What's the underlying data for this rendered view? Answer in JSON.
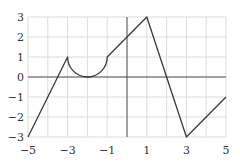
{
  "chart_data": {
    "type": "line",
    "title": "",
    "xlabel": "",
    "ylabel": "",
    "xlim": [
      -5,
      5
    ],
    "ylim": [
      -3,
      3
    ],
    "grid": true,
    "x_ticks": [
      -5,
      -3,
      -1,
      1,
      3,
      5
    ],
    "x_tick_labels": [
      "−5",
      "−3",
      "−1",
      "1",
      "3",
      "5"
    ],
    "y_ticks": [
      -3,
      -2,
      -1,
      0,
      1,
      2,
      3
    ],
    "y_tick_labels": [
      "−3",
      "−2",
      "−1",
      "0",
      "1",
      "2",
      "3"
    ],
    "series": [
      {
        "name": "f(x)",
        "description": "Piecewise graph: line, lower semicircle, line, line, line",
        "segments": [
          {
            "kind": "line",
            "points": [
              [
                -5,
                -3
              ],
              [
                -3,
                1
              ]
            ]
          },
          {
            "kind": "semicircle-lower",
            "center": [
              -2,
              1
            ],
            "radius": 1,
            "from": [
              -3,
              1
            ],
            "to": [
              -1,
              1
            ]
          },
          {
            "kind": "line",
            "points": [
              [
                -1,
                1
              ],
              [
                1,
                3
              ]
            ]
          },
          {
            "kind": "line",
            "points": [
              [
                1,
                3
              ],
              [
                3,
                -3
              ]
            ]
          },
          {
            "kind": "line",
            "points": [
              [
                3,
                -3
              ],
              [
                5,
                -1
              ]
            ]
          }
        ]
      }
    ],
    "colors": {
      "curve": "#3a3a3a",
      "grid": "#dcdcdc",
      "axis": "#555555"
    }
  }
}
